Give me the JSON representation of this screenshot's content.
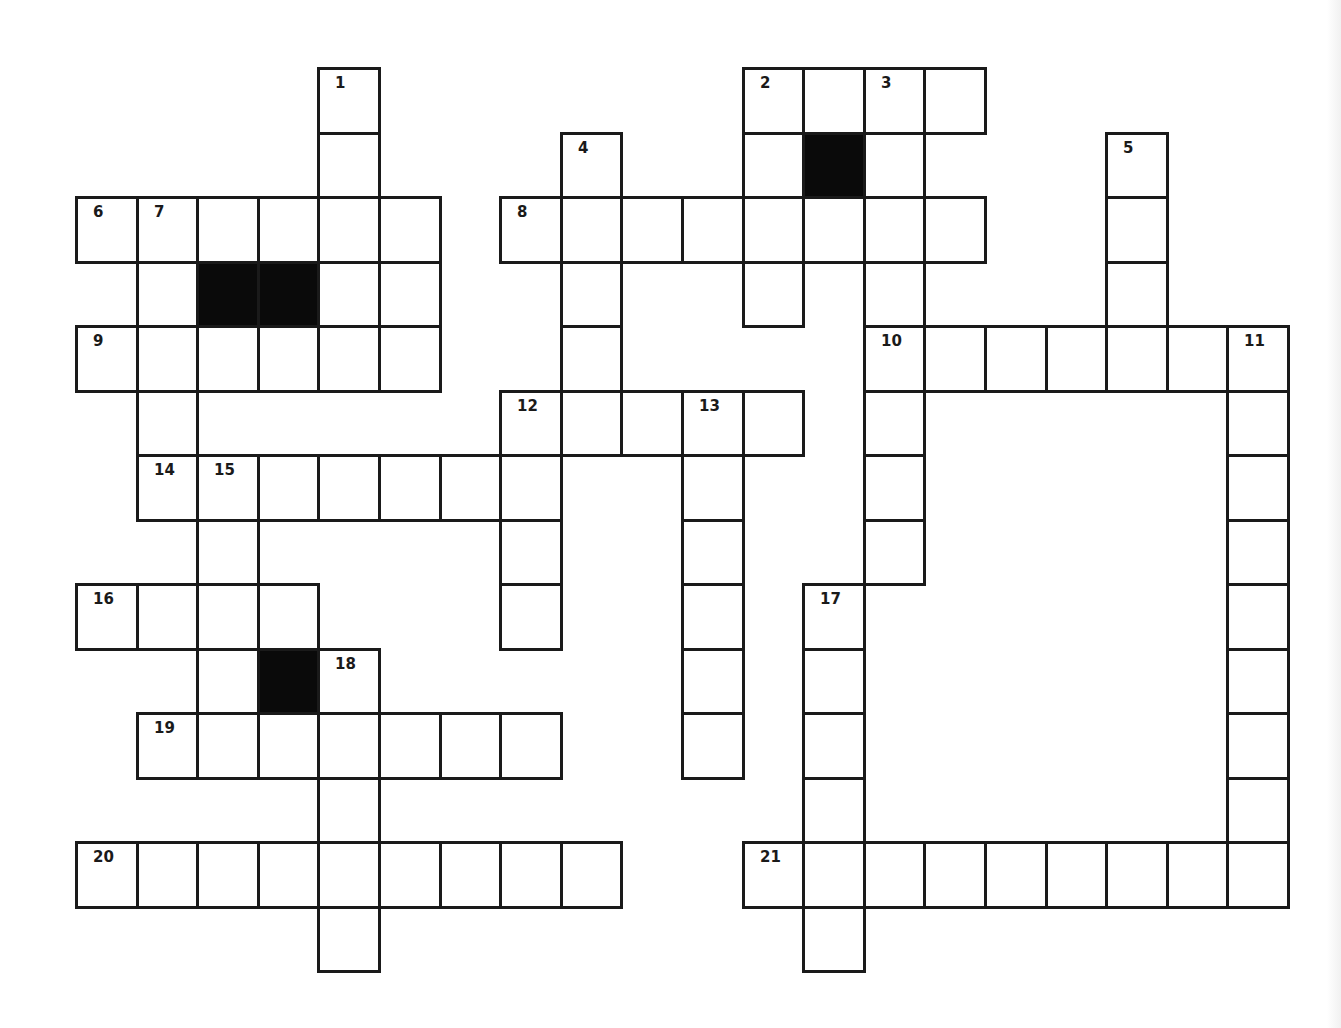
{
  "puzzle": {
    "grid": {
      "origin_x": 76,
      "origin_y": 68,
      "cell_w": 60.6,
      "cell_h": 64.5,
      "rows": 14,
      "cols": 20
    },
    "colors": {
      "border": "#1a1a1a",
      "block": "#0a0a0a",
      "cell": "#ffffff"
    },
    "cells": [
      {
        "r": 0,
        "c": 4,
        "n": "1"
      },
      {
        "r": 0,
        "c": 11,
        "n": "2"
      },
      {
        "r": 0,
        "c": 12
      },
      {
        "r": 0,
        "c": 13,
        "n": "3"
      },
      {
        "r": 0,
        "c": 14
      },
      {
        "r": 1,
        "c": 4
      },
      {
        "r": 1,
        "c": 8,
        "n": "4"
      },
      {
        "r": 1,
        "c": 11
      },
      {
        "r": 1,
        "c": 12,
        "black": true
      },
      {
        "r": 1,
        "c": 13
      },
      {
        "r": 1,
        "c": 17,
        "n": "5"
      },
      {
        "r": 2,
        "c": 0,
        "n": "6"
      },
      {
        "r": 2,
        "c": 1,
        "n": "7"
      },
      {
        "r": 2,
        "c": 2
      },
      {
        "r": 2,
        "c": 3
      },
      {
        "r": 2,
        "c": 4
      },
      {
        "r": 2,
        "c": 5
      },
      {
        "r": 2,
        "c": 7,
        "n": "8"
      },
      {
        "r": 2,
        "c": 8
      },
      {
        "r": 2,
        "c": 9
      },
      {
        "r": 2,
        "c": 10
      },
      {
        "r": 2,
        "c": 11
      },
      {
        "r": 2,
        "c": 12
      },
      {
        "r": 2,
        "c": 13
      },
      {
        "r": 2,
        "c": 14
      },
      {
        "r": 2,
        "c": 17
      },
      {
        "r": 3,
        "c": 1
      },
      {
        "r": 3,
        "c": 2,
        "black": true
      },
      {
        "r": 3,
        "c": 3,
        "black": true
      },
      {
        "r": 3,
        "c": 4
      },
      {
        "r": 3,
        "c": 5
      },
      {
        "r": 3,
        "c": 8
      },
      {
        "r": 3,
        "c": 11
      },
      {
        "r": 3,
        "c": 13
      },
      {
        "r": 3,
        "c": 17
      },
      {
        "r": 4,
        "c": 0,
        "n": "9"
      },
      {
        "r": 4,
        "c": 1
      },
      {
        "r": 4,
        "c": 2
      },
      {
        "r": 4,
        "c": 3
      },
      {
        "r": 4,
        "c": 4
      },
      {
        "r": 4,
        "c": 5
      },
      {
        "r": 4,
        "c": 8
      },
      {
        "r": 4,
        "c": 13,
        "n": "10"
      },
      {
        "r": 4,
        "c": 14
      },
      {
        "r": 4,
        "c": 15
      },
      {
        "r": 4,
        "c": 16
      },
      {
        "r": 4,
        "c": 17
      },
      {
        "r": 4,
        "c": 18
      },
      {
        "r": 4,
        "c": 19,
        "n": "11"
      },
      {
        "r": 5,
        "c": 1
      },
      {
        "r": 5,
        "c": 7,
        "n": "12"
      },
      {
        "r": 5,
        "c": 8
      },
      {
        "r": 5,
        "c": 9
      },
      {
        "r": 5,
        "c": 10,
        "n": "13"
      },
      {
        "r": 5,
        "c": 11
      },
      {
        "r": 5,
        "c": 13
      },
      {
        "r": 5,
        "c": 19
      },
      {
        "r": 6,
        "c": 1,
        "n": "14"
      },
      {
        "r": 6,
        "c": 2,
        "n": "15"
      },
      {
        "r": 6,
        "c": 3
      },
      {
        "r": 6,
        "c": 4
      },
      {
        "r": 6,
        "c": 5
      },
      {
        "r": 6,
        "c": 6
      },
      {
        "r": 6,
        "c": 7
      },
      {
        "r": 6,
        "c": 10
      },
      {
        "r": 6,
        "c": 13
      },
      {
        "r": 6,
        "c": 19
      },
      {
        "r": 7,
        "c": 2
      },
      {
        "r": 7,
        "c": 7
      },
      {
        "r": 7,
        "c": 10
      },
      {
        "r": 7,
        "c": 13
      },
      {
        "r": 7,
        "c": 19
      },
      {
        "r": 8,
        "c": 0,
        "n": "16"
      },
      {
        "r": 8,
        "c": 1
      },
      {
        "r": 8,
        "c": 2
      },
      {
        "r": 8,
        "c": 3
      },
      {
        "r": 8,
        "c": 7
      },
      {
        "r": 8,
        "c": 10
      },
      {
        "r": 8,
        "c": 12,
        "n": "17"
      },
      {
        "r": 8,
        "c": 19
      },
      {
        "r": 9,
        "c": 2
      },
      {
        "r": 9,
        "c": 3,
        "black": true
      },
      {
        "r": 9,
        "c": 4,
        "n": "18"
      },
      {
        "r": 9,
        "c": 10
      },
      {
        "r": 9,
        "c": 12
      },
      {
        "r": 9,
        "c": 19
      },
      {
        "r": 10,
        "c": 1,
        "n": "19"
      },
      {
        "r": 10,
        "c": 2
      },
      {
        "r": 10,
        "c": 3
      },
      {
        "r": 10,
        "c": 4
      },
      {
        "r": 10,
        "c": 5
      },
      {
        "r": 10,
        "c": 6
      },
      {
        "r": 10,
        "c": 7
      },
      {
        "r": 10,
        "c": 10
      },
      {
        "r": 10,
        "c": 12
      },
      {
        "r": 10,
        "c": 19
      },
      {
        "r": 11,
        "c": 4
      },
      {
        "r": 11,
        "c": 12
      },
      {
        "r": 11,
        "c": 19
      },
      {
        "r": 12,
        "c": 0,
        "n": "20"
      },
      {
        "r": 12,
        "c": 1
      },
      {
        "r": 12,
        "c": 2
      },
      {
        "r": 12,
        "c": 3
      },
      {
        "r": 12,
        "c": 4
      },
      {
        "r": 12,
        "c": 5
      },
      {
        "r": 12,
        "c": 6
      },
      {
        "r": 12,
        "c": 7
      },
      {
        "r": 12,
        "c": 8
      },
      {
        "r": 12,
        "c": 11,
        "n": "21"
      },
      {
        "r": 12,
        "c": 12
      },
      {
        "r": 12,
        "c": 13
      },
      {
        "r": 12,
        "c": 14
      },
      {
        "r": 12,
        "c": 15
      },
      {
        "r": 12,
        "c": 16
      },
      {
        "r": 12,
        "c": 17
      },
      {
        "r": 12,
        "c": 18
      },
      {
        "r": 12,
        "c": 19
      },
      {
        "r": 13,
        "c": 4
      },
      {
        "r": 13,
        "c": 12
      }
    ],
    "clue_numbers": {
      "across": [
        "2",
        "6",
        "8",
        "9",
        "10",
        "12",
        "14",
        "16",
        "19",
        "20",
        "21"
      ],
      "down": [
        "1",
        "3",
        "4",
        "5",
        "7",
        "11",
        "13",
        "15",
        "17",
        "18"
      ]
    }
  }
}
